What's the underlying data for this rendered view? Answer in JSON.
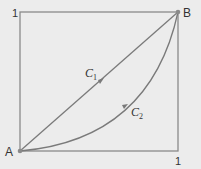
{
  "diagram": {
    "type": "path-comparison",
    "points": {
      "A": {
        "label": "A",
        "coords": [
          0,
          0
        ]
      },
      "B": {
        "label": "B",
        "coords": [
          1,
          1
        ]
      }
    },
    "axis_labels": {
      "y_top": "1",
      "x_right": "1"
    },
    "curves": [
      {
        "name": "C",
        "subscript": "1",
        "kind": "straight line from A to B"
      },
      {
        "name": "C",
        "subscript": "2",
        "kind": "curve from A to B bowing below the line"
      }
    ],
    "colors": {
      "background": "#ececec",
      "line": "#7a7a7a",
      "text": "#333333"
    }
  }
}
